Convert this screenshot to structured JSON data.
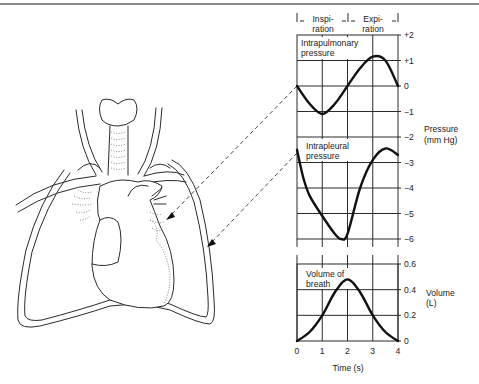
{
  "figure": {
    "phases": [
      {
        "label_line1": "Inspi-",
        "label_line2": "ration"
      },
      {
        "label_line1": "Expi-",
        "label_line2": "ration"
      }
    ],
    "panels": {
      "intrapulmonary": {
        "label_line1": "Intrapulmonary",
        "label_line2": "pressure"
      },
      "intrapleural": {
        "label_line1": "Intrapleural",
        "label_line2": "pressure"
      },
      "volume": {
        "label_line1": "Volume of",
        "label_line2": "breath"
      }
    },
    "pressure_axis": {
      "label_line1": "Pressure",
      "label_line2": "(mm Hg)",
      "ticks": [
        "+2",
        "+1",
        "0",
        "−1",
        "−2",
        "−3",
        "−4",
        "−5",
        "−6"
      ]
    },
    "volume_axis": {
      "label_line1": "Volume",
      "label_line2": "(L)",
      "ticks": [
        "0.6",
        "0.4",
        "0.2",
        "0"
      ]
    },
    "time_axis": {
      "label": "Time (s)",
      "ticks": [
        "0",
        "1",
        "2",
        "3",
        "4"
      ]
    },
    "illustration": {
      "subject": "lungs-heart-trachea",
      "arrows": [
        "to-lung-surface-intrapulmonary",
        "to-pleura-intrapleural"
      ]
    }
  },
  "chart_data": [
    {
      "type": "line",
      "title": "Intrapulmonary pressure",
      "xlabel": "Time (s)",
      "ylabel": "Pressure (mm Hg)",
      "x": [
        0,
        0.5,
        1,
        1.5,
        2,
        2.5,
        3,
        3.5,
        4
      ],
      "values": [
        0,
        -0.7,
        -1.1,
        -0.7,
        0,
        0.7,
        1.15,
        1.0,
        0
      ],
      "xlim": [
        0,
        4
      ],
      "ylim": [
        -2,
        2
      ],
      "grid": true
    },
    {
      "type": "line",
      "title": "Intrapleural pressure",
      "xlabel": "Time (s)",
      "ylabel": "Pressure (mm Hg)",
      "x": [
        0,
        0.25,
        0.5,
        1,
        1.5,
        1.75,
        2,
        2.5,
        3,
        3.5,
        4
      ],
      "values": [
        -2.5,
        -3.6,
        -4.3,
        -5.1,
        -5.8,
        -6.0,
        -5.8,
        -4.0,
        -2.9,
        -2.45,
        -2.7
      ],
      "xlim": [
        0,
        4
      ],
      "ylim": [
        -6,
        -1
      ],
      "grid": true
    },
    {
      "type": "line",
      "title": "Volume of breath",
      "xlabel": "Time (s)",
      "ylabel": "Volume (L)",
      "x": [
        0,
        0.5,
        1,
        1.5,
        2,
        2.5,
        3,
        3.5,
        4
      ],
      "values": [
        0,
        0.07,
        0.2,
        0.38,
        0.48,
        0.38,
        0.2,
        0.07,
        0
      ],
      "xlim": [
        0,
        4
      ],
      "ylim": [
        0,
        0.6
      ],
      "grid": true
    }
  ]
}
